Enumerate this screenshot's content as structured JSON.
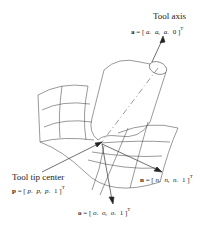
{
  "diagram": {
    "tool_axis": {
      "title": "Tool axis",
      "symbol": "a",
      "equation": "a = [ aₓ  aᵧ  a_z  0 ]ᵀ",
      "components": [
        "aₓ",
        "aᵧ",
        "aₓ",
        "0"
      ],
      "superscript": "T"
    },
    "tool_tip": {
      "title": "Tool tip center",
      "symbol": "p",
      "equation": "p = [ pₓ  pᵧ  p_z  1 ]ᵀ",
      "components": [
        "pₓ",
        "pᵧ",
        "pₓ",
        "1"
      ],
      "superscript": "T"
    },
    "normal": {
      "symbol": "n",
      "equation": "n = [ nₓ  nᵧ  n_z  1 ]ᵀ",
      "components": [
        "nₓ",
        "nᵧ",
        "nₓ",
        "1"
      ],
      "superscript": "T"
    },
    "orientation": {
      "symbol": "o",
      "equation": "o = [ oₓ  oᵧ  o_z  1 ]ᵀ",
      "components": [
        "oₓ",
        "oᵧ",
        "oₓ",
        "1"
      ],
      "superscript": "T"
    },
    "colors": {
      "line": "#444444",
      "text": "#222222",
      "background": "#ffffff"
    }
  }
}
